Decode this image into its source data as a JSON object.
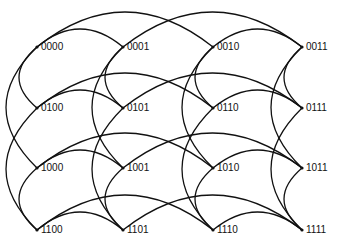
{
  "diagram": {
    "type": "graph",
    "line_color": "#111111",
    "columns_x": [
      37,
      123,
      213,
      302
    ],
    "rows_y": [
      47,
      108,
      168,
      230
    ],
    "nodes": [
      {
        "label": "0000",
        "row": 0,
        "col": 0
      },
      {
        "label": "0001",
        "row": 0,
        "col": 1
      },
      {
        "label": "0010",
        "row": 0,
        "col": 2
      },
      {
        "label": "0011",
        "row": 0,
        "col": 3
      },
      {
        "label": "0100",
        "row": 1,
        "col": 0
      },
      {
        "label": "0101",
        "row": 1,
        "col": 1
      },
      {
        "label": "0110",
        "row": 1,
        "col": 2
      },
      {
        "label": "0111",
        "row": 1,
        "col": 3
      },
      {
        "label": "1000",
        "row": 2,
        "col": 0
      },
      {
        "label": "1001",
        "row": 2,
        "col": 1
      },
      {
        "label": "1010",
        "row": 2,
        "col": 2
      },
      {
        "label": "1011",
        "row": 2,
        "col": 3
      },
      {
        "label": "1100",
        "row": 3,
        "col": 0
      },
      {
        "label": "1101",
        "row": 3,
        "col": 1
      },
      {
        "label": "1110",
        "row": 3,
        "col": 2
      },
      {
        "label": "1111",
        "row": 3,
        "col": 3
      }
    ]
  }
}
